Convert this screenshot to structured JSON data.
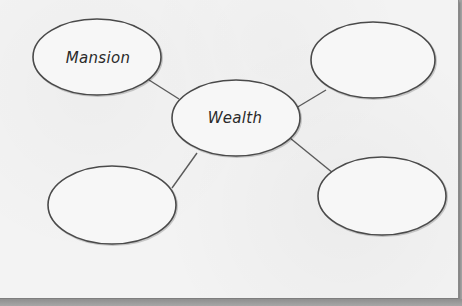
{
  "diagram": {
    "type": "mind-map",
    "colors": {
      "page": "#f3f3f3",
      "background": "#a3a3a3",
      "outline": "#4a4a4a",
      "text": "#2a2a2a"
    },
    "center": {
      "label": "Wealth",
      "cx": 236,
      "cy": 118,
      "rx": 64,
      "ry": 38
    },
    "nodes": [
      {
        "label": "Mansion",
        "position": "top-left",
        "cx": 97,
        "cy": 57,
        "rx": 64,
        "ry": 38
      },
      {
        "label": "",
        "position": "top-right",
        "cx": 373,
        "cy": 60,
        "rx": 62,
        "ry": 38
      },
      {
        "label": "",
        "position": "bottom-left",
        "cx": 112,
        "cy": 205,
        "rx": 64,
        "ry": 39
      },
      {
        "label": "",
        "position": "bottom-right",
        "cx": 382,
        "cy": 196,
        "rx": 64,
        "ry": 39
      }
    ],
    "connectors": [
      {
        "from": "Wealth",
        "to": "top-left",
        "x1": 179,
        "y1": 99,
        "x2": 149,
        "y2": 80
      },
      {
        "from": "Wealth",
        "to": "top-right",
        "x1": 296,
        "y1": 108,
        "x2": 326,
        "y2": 90
      },
      {
        "from": "Wealth",
        "to": "bottom-left",
        "x1": 197,
        "y1": 153,
        "x2": 172,
        "y2": 188
      },
      {
        "from": "Wealth",
        "to": "bottom-right",
        "x1": 290,
        "y1": 138,
        "x2": 333,
        "y2": 173
      }
    ]
  }
}
